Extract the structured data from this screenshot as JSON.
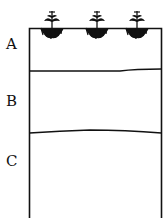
{
  "diagram": {
    "type": "soil-profile",
    "layers": [
      {
        "label": "A",
        "name": "horizon-a",
        "has_plants": true,
        "plant_count": 3
      },
      {
        "label": "B",
        "name": "horizon-b"
      },
      {
        "label": "C",
        "name": "horizon-c"
      }
    ],
    "colors": {
      "line": "#111111",
      "background": "#ffffff"
    }
  }
}
